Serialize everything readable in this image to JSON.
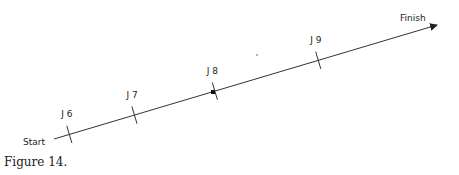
{
  "diagram": {
    "start_label": "Start",
    "finish_label": "Finish",
    "junctions": [
      {
        "label": "J 6",
        "position": 0.04
      },
      {
        "label": "J 7",
        "position": 0.21
      },
      {
        "label": "J 8",
        "position": 0.42
      },
      {
        "label": "J 9",
        "position": 0.69
      }
    ],
    "caption": "Figure 14."
  }
}
